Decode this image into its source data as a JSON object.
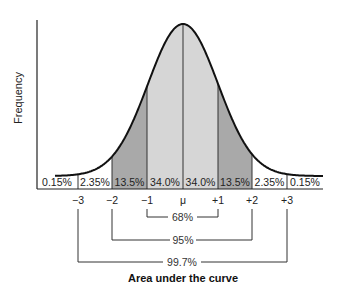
{
  "chart_data": {
    "type": "area",
    "title": "Area under the curve",
    "ylabel": "Frequency",
    "xlabel": "",
    "x_ticks": [
      "−3",
      "−2",
      "−1",
      "μ",
      "+1",
      "+2",
      "+3"
    ],
    "regions": [
      {
        "range": [
          "<−3",
          "−3"
        ],
        "percent": "0.15%",
        "fill": "#ffffff"
      },
      {
        "range": [
          "−3",
          "−2"
        ],
        "percent": "2.35%",
        "fill": "#ffffff"
      },
      {
        "range": [
          "−2",
          "−1"
        ],
        "percent": "13.5%",
        "fill": "#a9a9a9"
      },
      {
        "range": [
          "−1",
          "μ"
        ],
        "percent": "34.0%",
        "fill": "#d6d6d6"
      },
      {
        "range": [
          "μ",
          "+1"
        ],
        "percent": "34.0%",
        "fill": "#d6d6d6"
      },
      {
        "range": [
          "+1",
          "+2"
        ],
        "percent": "13.5%",
        "fill": "#a9a9a9"
      },
      {
        "range": [
          "+2",
          "+3"
        ],
        "percent": "2.35%",
        "fill": "#ffffff"
      },
      {
        "range": [
          "+3",
          ">+3"
        ],
        "percent": "0.15%",
        "fill": "#ffffff"
      }
    ],
    "brackets": [
      {
        "from": "−1",
        "to": "+1",
        "label": "68%"
      },
      {
        "from": "−2",
        "to": "+2",
        "label": "95%"
      },
      {
        "from": "−3",
        "to": "+3",
        "label": "99.7%"
      }
    ],
    "grid": false,
    "legend": "none"
  },
  "labels": {
    "ylabel": "Frequency",
    "title": "Area under the curve",
    "ticks": [
      "−3",
      "−2",
      "−1",
      "μ",
      "+1",
      "+2",
      "+3"
    ],
    "percents": [
      "0.15%",
      "2.35%",
      "13.5%",
      "34.0%",
      "34.0%",
      "13.5%",
      "2.35%",
      "0.15%"
    ],
    "brackets": [
      "68%",
      "95%",
      "99.7%"
    ]
  },
  "colors": {
    "outer_band": "#a9a9a9",
    "inner_band": "#d6d6d6",
    "line": "#111111"
  }
}
